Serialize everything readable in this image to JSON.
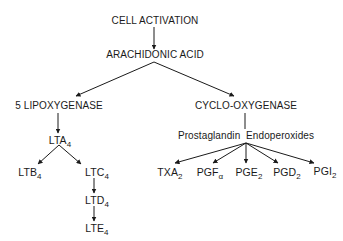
{
  "nodes": {
    "cell_activation": "CELL ACTIVATION",
    "arachidonic_acid": "ARACHIDONIC ACID",
    "lipoxygenase": "5 LIPOXYGENASE",
    "cyclooxygenase": "CYCLO-OXYGENASE",
    "endoperoxides": "Prostaglandin  Endoperoxides",
    "lta4": {
      "base": "LTA",
      "sub": "4"
    },
    "ltb4": {
      "base": "LTB",
      "sub": "4"
    },
    "ltc4": {
      "base": "LTC",
      "sub": "4"
    },
    "ltd4": {
      "base": "LTD",
      "sub": "4"
    },
    "lte4": {
      "base": "LTE",
      "sub": "4"
    },
    "txa2": {
      "base": "TXA",
      "sub": "2"
    },
    "pgfa": {
      "base": "PGF",
      "sub": "α"
    },
    "pge2": {
      "base": "PGE",
      "sub": "2"
    },
    "pgd2": {
      "base": "PGD",
      "sub": "2"
    },
    "pgi2": {
      "base": "PGI",
      "sub": "2"
    }
  },
  "edges": [
    [
      "CELL ACTIVATION",
      "ARACHIDONIC ACID"
    ],
    [
      "ARACHIDONIC ACID",
      "5 LIPOXYGENASE"
    ],
    [
      "ARACHIDONIC ACID",
      "CYCLO-OXYGENASE"
    ],
    [
      "5 LIPOXYGENASE",
      "LTA4"
    ],
    [
      "LTA4",
      "LTB4"
    ],
    [
      "LTA4",
      "LTC4"
    ],
    [
      "LTC4",
      "LTD4"
    ],
    [
      "LTD4",
      "LTE4"
    ],
    [
      "CYCLO-OXYGENASE",
      "Prostaglandin Endoperoxides"
    ],
    [
      "Prostaglandin Endoperoxides",
      "TXA2"
    ],
    [
      "Prostaglandin Endoperoxides",
      "PGFα"
    ],
    [
      "Prostaglandin Endoperoxides",
      "PGE2"
    ],
    [
      "Prostaglandin Endoperoxides",
      "PGD2"
    ],
    [
      "Prostaglandin Endoperoxides",
      "PGI2"
    ]
  ],
  "colors": {
    "ink": "#1a1a1a",
    "background": "#ffffff"
  }
}
